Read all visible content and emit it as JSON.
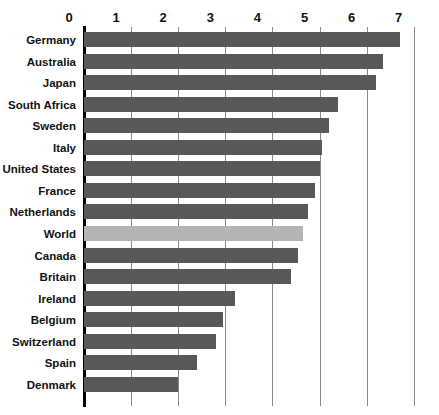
{
  "chart_data": {
    "type": "bar",
    "orientation": "horizontal",
    "title": "",
    "subtitle": "",
    "xlabel": "",
    "ylabel": "",
    "xlim": [
      0,
      7
    ],
    "ylim": null,
    "grid": true,
    "legend": null,
    "xticks": [
      "0",
      "1",
      "2",
      "3",
      "4",
      "5",
      "6",
      "7"
    ],
    "xtick_values": [
      0,
      1,
      2,
      3,
      4,
      5,
      6,
      7
    ],
    "categories": [
      "Germany",
      "Australia",
      "Japan",
      "South Africa",
      "Sweden",
      "Italy",
      "United States",
      "France",
      "Netherlands",
      "World",
      "Canada",
      "Britain",
      "Ireland",
      "Belgium",
      "Switzerland",
      "Spain",
      "Denmark"
    ],
    "values": [
      6.7,
      6.35,
      6.2,
      5.4,
      5.2,
      5.05,
      5.0,
      4.9,
      4.75,
      4.65,
      4.55,
      4.4,
      3.2,
      2.95,
      2.8,
      2.4,
      2.0
    ],
    "highlight_category": "World",
    "colors": {
      "bar": "#58585a",
      "bar_highlight": "#b4b4b4",
      "axis": "#000000",
      "gridline": "#8a8a8a",
      "text": "#121212",
      "background": "#ffffff"
    }
  }
}
